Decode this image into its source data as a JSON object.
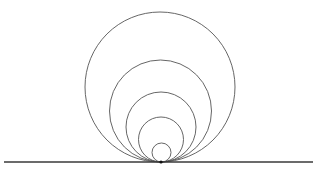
{
  "figure": {
    "canvas": {
      "width": 317,
      "height": 175,
      "background_color": "#ffffff"
    },
    "stroke": {
      "circle_color": "#555555",
      "circle_width": 0.9,
      "line_color": "#3a3a3a",
      "line_width": 1.6,
      "point_color": "#101010"
    },
    "tangent_point": {
      "label": "tangency-point",
      "x": 161,
      "y": 162,
      "radius": 1.6
    },
    "baseline": {
      "label": "horizontal-baseline",
      "x1": 4,
      "y1": 162,
      "x2": 313,
      "y2": 162
    },
    "circles": [
      {
        "name": "circle-1-outermost",
        "cx": 160,
        "cy": 87,
        "r": 75,
        "top_y": 12,
        "diameter": 150
      },
      {
        "name": "circle-2",
        "cx": 160.5,
        "cy": 111,
        "r": 51,
        "top_y": 60,
        "diameter": 102
      },
      {
        "name": "circle-3",
        "cx": 161,
        "cy": 127,
        "r": 35,
        "top_y": 92,
        "diameter": 70
      },
      {
        "name": "circle-4",
        "cx": 161,
        "cy": 139.5,
        "r": 22.5,
        "top_y": 117,
        "diameter": 45
      },
      {
        "name": "circle-5-innermost",
        "cx": 161.5,
        "cy": 152.5,
        "r": 9.5,
        "top_y": 143,
        "diameter": 19
      }
    ]
  },
  "chart_data": {
    "type": "scatter",
    "xlabel": "",
    "ylabel": "",
    "xlim": [
      0,
      317
    ],
    "ylim": [
      0,
      175
    ],
    "grid": false,
    "legend": "none",
    "series": [
      {
        "name": "circle-1-outermost",
        "cx": 160,
        "cy": 87,
        "r": 75
      },
      {
        "name": "circle-2",
        "cx": 160.5,
        "cy": 111,
        "r": 51
      },
      {
        "name": "circle-3",
        "cx": 161,
        "cy": 127,
        "r": 35
      },
      {
        "name": "circle-4",
        "cx": 161,
        "cy": 139.5,
        "r": 22.5
      },
      {
        "name": "circle-5-innermost",
        "cx": 161.5,
        "cy": 152.5,
        "r": 9.5
      }
    ],
    "annotations": [
      {
        "name": "tangency-point",
        "x": 161,
        "y": 162
      },
      {
        "name": "horizontal-baseline",
        "x1": 4,
        "y1": 162,
        "x2": 313,
        "y2": 162
      }
    ]
  }
}
